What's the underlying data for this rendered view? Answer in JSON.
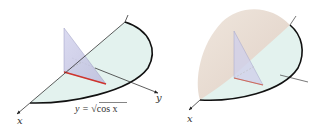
{
  "figures": [
    {
      "id": "left",
      "description": "Base region bounded by x-axis (y=0) and curve y = sqrt(cos x) with a triangular cross-section perpendicular to the x-axis",
      "axis_labels": {
        "x": "x",
        "y": "y"
      },
      "equation": {
        "prefix": "y = ",
        "radical": "√",
        "radicand": "cos x"
      }
    },
    {
      "id": "right",
      "description": "Solid formed by stacking triangular cross-sections over the base region",
      "axis_labels": {
        "x": "x",
        "y": "y"
      }
    }
  ],
  "colors": {
    "region_fill": "#e3f2ee",
    "solid_fill": "#eadfd6",
    "triangle_fill": "#c9c9e6",
    "cross_section_base": "#d0342c",
    "curve_stroke": "#111111",
    "axis_stroke": "#333333"
  }
}
